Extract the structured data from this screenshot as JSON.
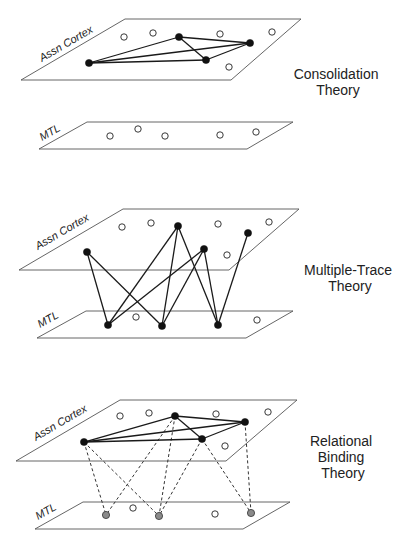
{
  "panels": [
    {
      "id": "consolidation",
      "title_lines": [
        "Consolidation",
        "Theory"
      ],
      "title_pos": [
        338,
        79
      ],
      "cortex": {
        "label": "Assn Cortex",
        "plane": [
          [
            21,
            80
          ],
          [
            125,
            19
          ],
          [
            301,
            19
          ],
          [
            231,
            80
          ]
        ],
        "label_pos": [
          42,
          62
        ],
        "inactive_nodes": [
          [
            124,
            37
          ],
          [
            153,
            33
          ],
          [
            220,
            34
          ],
          [
            272,
            32
          ],
          [
            229,
            67
          ]
        ],
        "active_nodes": [
          [
            89,
            63
          ],
          [
            179,
            37
          ],
          [
            250,
            43
          ],
          [
            206,
            60
          ]
        ],
        "solid_edges": [
          [
            0,
            1
          ],
          [
            0,
            2
          ],
          [
            0,
            3
          ],
          [
            1,
            2
          ],
          [
            1,
            3
          ],
          [
            3,
            2
          ]
        ]
      },
      "mtl": {
        "label": "MTL",
        "plane": [
          [
            39,
            149
          ],
          [
            87,
            122
          ],
          [
            293,
            122
          ],
          [
            247,
            149
          ]
        ],
        "label_pos": [
          42,
          141
        ],
        "inactive_nodes": [
          [
            110,
            136
          ],
          [
            138,
            129
          ],
          [
            165,
            136
          ],
          [
            220,
            135
          ],
          [
            256,
            132
          ]
        ],
        "active_nodes": [],
        "gray_nodes": []
      },
      "cross_edges": [],
      "cross_style": "none"
    },
    {
      "id": "multiple-trace",
      "title_lines": [
        "Multiple-Trace",
        "Theory"
      ],
      "title_pos": [
        350,
        275
      ],
      "cortex": {
        "label": "Assn Cortex",
        "plane": [
          [
            19,
            270
          ],
          [
            123,
            209
          ],
          [
            299,
            209
          ],
          [
            229,
            270
          ]
        ],
        "label_pos": [
          38,
          250
        ],
        "inactive_nodes": [
          [
            122,
            227
          ],
          [
            151,
            223
          ],
          [
            218,
            224
          ],
          [
            269,
            222
          ],
          [
            227,
            255
          ]
        ],
        "active_nodes": [
          [
            87,
            252
          ],
          [
            178,
            226
          ],
          [
            204,
            249
          ],
          [
            248,
            233
          ]
        ],
        "solid_edges": []
      },
      "mtl": {
        "label": "MTL",
        "plane": [
          [
            37,
            338
          ],
          [
            86,
            311
          ],
          [
            293,
            311
          ],
          [
            246,
            338
          ]
        ],
        "label_pos": [
          40,
          328
        ],
        "inactive_nodes": [
          [
            136,
            317
          ],
          [
            257,
            320
          ]
        ],
        "active_nodes": [
          [
            108,
            325
          ],
          [
            162,
            326
          ],
          [
            218,
            325
          ]
        ],
        "gray_nodes": []
      },
      "cross_edges": [
        [
          0,
          0
        ],
        [
          0,
          1
        ],
        [
          1,
          0
        ],
        [
          1,
          1
        ],
        [
          1,
          2
        ],
        [
          2,
          0
        ],
        [
          2,
          1
        ],
        [
          2,
          2
        ],
        [
          3,
          2
        ]
      ],
      "cross_style": "solid"
    },
    {
      "id": "relational-binding",
      "title_lines": [
        "Relational",
        "Binding",
        "Theory"
      ],
      "title_pos": [
        343,
        446
      ],
      "cortex": {
        "label": "Assn Cortex",
        "plane": [
          [
            16,
            461
          ],
          [
            120,
            400
          ],
          [
            297,
            400
          ],
          [
            226,
            461
          ]
        ],
        "label_pos": [
          36,
          441
        ],
        "inactive_nodes": [
          [
            120,
            416
          ],
          [
            149,
            413
          ],
          [
            216,
            414
          ],
          [
            268,
            412
          ],
          [
            225,
            446
          ]
        ],
        "active_nodes": [
          [
            84,
            442
          ],
          [
            175,
            416
          ],
          [
            202,
            439
          ],
          [
            245,
            422
          ]
        ],
        "solid_edges": [
          [
            0,
            1
          ],
          [
            0,
            2
          ],
          [
            0,
            3
          ],
          [
            1,
            2
          ],
          [
            1,
            3
          ],
          [
            2,
            3
          ]
        ]
      },
      "mtl": {
        "label": "MTL",
        "plane": [
          [
            35,
            529
          ],
          [
            83,
            502
          ],
          [
            290,
            502
          ],
          [
            243,
            529
          ]
        ],
        "label_pos": [
          38,
          520
        ],
        "inactive_nodes": [
          [
            133,
            508
          ],
          [
            215,
            514
          ]
        ],
        "active_nodes": [],
        "gray_nodes": [
          [
            106,
            515
          ],
          [
            159,
            516
          ],
          [
            251,
            513
          ]
        ]
      },
      "cross_edges": [
        [
          0,
          0
        ],
        [
          0,
          1
        ],
        [
          1,
          0
        ],
        [
          1,
          1
        ],
        [
          2,
          1
        ],
        [
          2,
          2
        ],
        [
          3,
          2
        ]
      ],
      "cross_style": "dashed"
    }
  ],
  "colors": {
    "plane_stroke": "#555555",
    "edge": "#1a1a1a",
    "node_active": "#111111",
    "node_gray": "#8a8a8a",
    "background": "#ffffff"
  }
}
